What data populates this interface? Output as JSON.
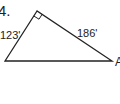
{
  "problem": {
    "number": "4."
  },
  "triangle": {
    "type": "right",
    "vertices": {
      "top": [
        37,
        11
      ],
      "bottom_left": [
        5,
        61
      ],
      "bottom_right": [
        112,
        61
      ]
    },
    "right_angle_at": "top",
    "side_labels": {
      "left_leg": "123'",
      "right_leg": "186'"
    },
    "vertex_labels": {
      "bottom_right": "A"
    },
    "stroke_color": "#222222"
  }
}
